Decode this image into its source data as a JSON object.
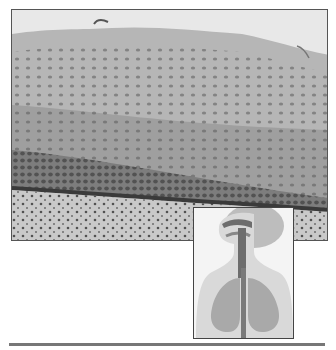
{
  "figure": {
    "main_image": {
      "subject": "micrograph-stratified-squamous-epithelium",
      "colors": {
        "background": "#e6e6e6",
        "tissue_light": "#b8b8b8",
        "tissue_mid": "#8e8e8e",
        "basal_dark": "#555555",
        "nuclei": "#4a4a4a"
      }
    },
    "inset_image": {
      "subject": "respiratory-tract-diagram",
      "colors": {
        "background": "#f4f4f4",
        "body": "#d8d8d8",
        "airway": "#6d6d6d",
        "lungs": "#a9a9a9"
      }
    },
    "rule_color": "#777777"
  }
}
